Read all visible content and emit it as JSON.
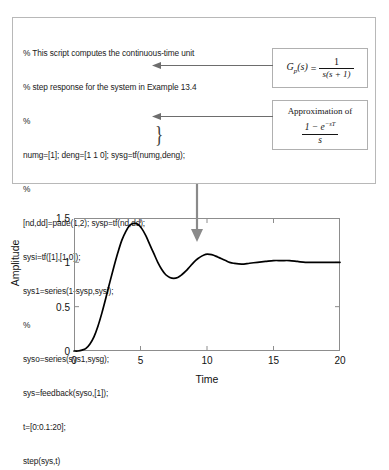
{
  "code_panel": {
    "lines": [
      "% This script computes the continuous-time unit",
      "% step response for the system in Example 13.4",
      "%",
      "numg=[1]; deng=[1 1 0]; sysg=tf(numg,deng);",
      "%",
      "[nd,dd]=pade(1,2); sysp=tf(nd,dd);",
      "sysi=tf([1],[1,0]);",
      "sys1=series(1-sysp,sysi);",
      "%",
      "syso=series(sys1,sysg);",
      "sys=feedback(syso,[1]);",
      "t=[0:0.1:20];",
      "step(sys,t)"
    ],
    "brace_glyph": "}"
  },
  "annotations": {
    "gp_box": {
      "lhs": "G",
      "lhs_sub": "p",
      "lhs_arg": "(s)",
      "equals": "=",
      "numerator": "1",
      "denominator": "s(s + 1)"
    },
    "approx_box": {
      "caption": "Approximation of",
      "numerator": "1 − e",
      "numerator_exp": "−sT",
      "denominator": "s"
    },
    "arrow_gp_name": "arrow-to-plant-definition",
    "arrow_approx_name": "arrow-to-zoh-approximation",
    "arrow_plot_name": "arrow-to-step-response-plot"
  },
  "chart_data": {
    "type": "line",
    "title": "",
    "xlabel": "Time",
    "ylabel": "Amplitude",
    "xlim": [
      0,
      20
    ],
    "ylim": [
      0,
      1.5
    ],
    "xticks": [
      0,
      5,
      10,
      15,
      20
    ],
    "xtick_labels": [
      "0",
      "5",
      "10",
      "15",
      "20"
    ],
    "yticks": [
      0,
      0.5,
      1,
      1.5
    ],
    "ytick_labels": [
      "0",
      "0.5",
      "1",
      "1.5"
    ],
    "grid": false,
    "legend": null,
    "line_color": "#000000",
    "series": [
      {
        "name": "step response",
        "x": [
          0.0,
          0.3,
          0.6,
          0.9,
          1.2,
          1.5,
          1.8,
          2.1,
          2.4,
          2.7,
          3.0,
          3.3,
          3.6,
          3.9,
          4.2,
          4.5,
          4.8,
          5.1,
          5.4,
          5.7,
          6.0,
          6.3,
          6.6,
          6.9,
          7.2,
          7.5,
          7.8,
          8.1,
          8.4,
          8.7,
          9.0,
          9.3,
          9.6,
          9.9,
          10.2,
          10.5,
          10.8,
          11.1,
          11.4,
          11.7,
          12.0,
          12.6,
          13.2,
          13.8,
          14.4,
          15.0,
          15.6,
          16.2,
          16.8,
          17.4,
          18.0,
          18.6,
          19.2,
          20.0
        ],
        "y": [
          0.0,
          0.0,
          0.01,
          0.03,
          0.08,
          0.16,
          0.28,
          0.43,
          0.6,
          0.78,
          0.95,
          1.11,
          1.25,
          1.35,
          1.42,
          1.44,
          1.43,
          1.38,
          1.3,
          1.2,
          1.1,
          1.0,
          0.92,
          0.86,
          0.83,
          0.82,
          0.83,
          0.86,
          0.9,
          0.95,
          1.0,
          1.04,
          1.07,
          1.09,
          1.09,
          1.08,
          1.06,
          1.04,
          1.02,
          1.0,
          0.99,
          0.98,
          0.99,
          1.0,
          1.01,
          1.02,
          1.02,
          1.02,
          1.01,
          1.0,
          1.0,
          1.0,
          1.0,
          1.0
        ]
      }
    ]
  }
}
